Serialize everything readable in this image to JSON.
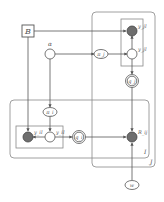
{
  "diagram": {
    "type": "probabilistic-graphical-model",
    "colors": {
      "stroke": "#666666",
      "observed_fill": "#6e6e6e",
      "latent_fill": "#ffffff",
      "plate_stroke": "#888888"
    },
    "nodes": {
      "B": {
        "label": "B",
        "shape": "square"
      },
      "alpha": {
        "label": "α",
        "shape": "circle"
      },
      "pi_j": {
        "label": "π_j",
        "shape": "ellipse"
      },
      "y_jl_obs": {
        "label": "y_jl",
        "shape": "circle",
        "observed": true
      },
      "y_jl_lat": {
        "label": "y_jl",
        "shape": "circle",
        "observed": false
      },
      "q_j": {
        "label": "q_j",
        "shape": "double-circle"
      },
      "pi_i": {
        "label": "π_i",
        "shape": "ellipse"
      },
      "y_il_obs": {
        "label": "y_il",
        "shape": "circle",
        "observed": true
      },
      "y_il_lat": {
        "label": "y_il",
        "shape": "circle",
        "observed": false
      },
      "q_i": {
        "label": "q_i",
        "shape": "double-circle"
      },
      "R_ij": {
        "label": "R_ij",
        "shape": "circle",
        "observed": true
      },
      "w": {
        "label": "w",
        "shape": "ellipse"
      }
    },
    "plates": {
      "J": {
        "label": "J"
      },
      "I": {
        "label": "I"
      },
      "L_top": {
        "label": ""
      },
      "L_bottom": {
        "label": ""
      }
    }
  }
}
